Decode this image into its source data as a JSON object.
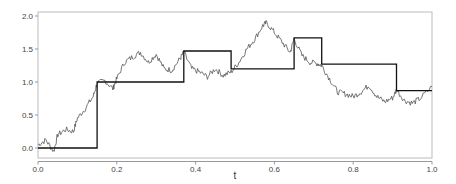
{
  "chart_data": {
    "type": "line",
    "title": "",
    "xlabel": "t",
    "ylabel": "",
    "xlim": [
      0.0,
      1.0
    ],
    "ylim": [
      -0.05,
      2.05
    ],
    "grid": false,
    "legend": null,
    "x_ticks": [
      "0.0",
      "0.2",
      "0.4",
      "0.6",
      "0.8",
      "1.0"
    ],
    "x_tick_values": [
      0.0,
      0.2,
      0.4,
      0.6,
      0.8,
      1.0
    ],
    "y_ticks": [
      "0.0",
      "0.5",
      "1.0",
      "1.5",
      "2.0"
    ],
    "y_tick_values": [
      0.0,
      0.5,
      1.0,
      1.5,
      2.0
    ],
    "series": [
      {
        "name": "random-walk path",
        "style": "thin noisy line",
        "color": "#555555",
        "x": [
          0.0,
          0.02,
          0.04,
          0.05,
          0.07,
          0.09,
          0.1,
          0.12,
          0.14,
          0.15,
          0.17,
          0.19,
          0.2,
          0.22,
          0.24,
          0.26,
          0.28,
          0.3,
          0.32,
          0.34,
          0.36,
          0.37,
          0.39,
          0.41,
          0.43,
          0.45,
          0.47,
          0.49,
          0.51,
          0.53,
          0.55,
          0.57,
          0.58,
          0.6,
          0.62,
          0.64,
          0.65,
          0.67,
          0.69,
          0.71,
          0.72,
          0.74,
          0.76,
          0.78,
          0.8,
          0.82,
          0.84,
          0.86,
          0.88,
          0.9,
          0.91,
          0.93,
          0.95,
          0.97,
          1.0
        ],
        "y": [
          0.05,
          0.12,
          -0.05,
          0.2,
          0.28,
          0.25,
          0.45,
          0.6,
          0.78,
          0.98,
          1.02,
          0.9,
          1.05,
          1.3,
          1.38,
          1.45,
          1.3,
          1.42,
          1.2,
          1.18,
          1.35,
          1.45,
          1.2,
          1.15,
          1.08,
          1.2,
          1.1,
          1.15,
          1.3,
          1.5,
          1.65,
          1.85,
          1.9,
          1.75,
          1.6,
          1.45,
          1.65,
          1.4,
          1.3,
          1.28,
          1.25,
          1.05,
          0.85,
          0.82,
          0.78,
          0.85,
          0.95,
          0.78,
          0.7,
          0.76,
          0.88,
          0.72,
          0.68,
          0.75,
          0.93
        ]
      },
      {
        "name": "step function",
        "style": "step, thick black line",
        "color": "#111111",
        "steps": [
          {
            "from": 0.0,
            "to": 0.15,
            "value": 0.0
          },
          {
            "from": 0.15,
            "to": 0.37,
            "value": 1.0
          },
          {
            "from": 0.37,
            "to": 0.49,
            "value": 1.47
          },
          {
            "from": 0.49,
            "to": 0.65,
            "value": 1.2
          },
          {
            "from": 0.65,
            "to": 0.72,
            "value": 1.67
          },
          {
            "from": 0.72,
            "to": 0.91,
            "value": 1.27
          },
          {
            "from": 0.91,
            "to": 1.0,
            "value": 0.87
          }
        ]
      }
    ]
  }
}
